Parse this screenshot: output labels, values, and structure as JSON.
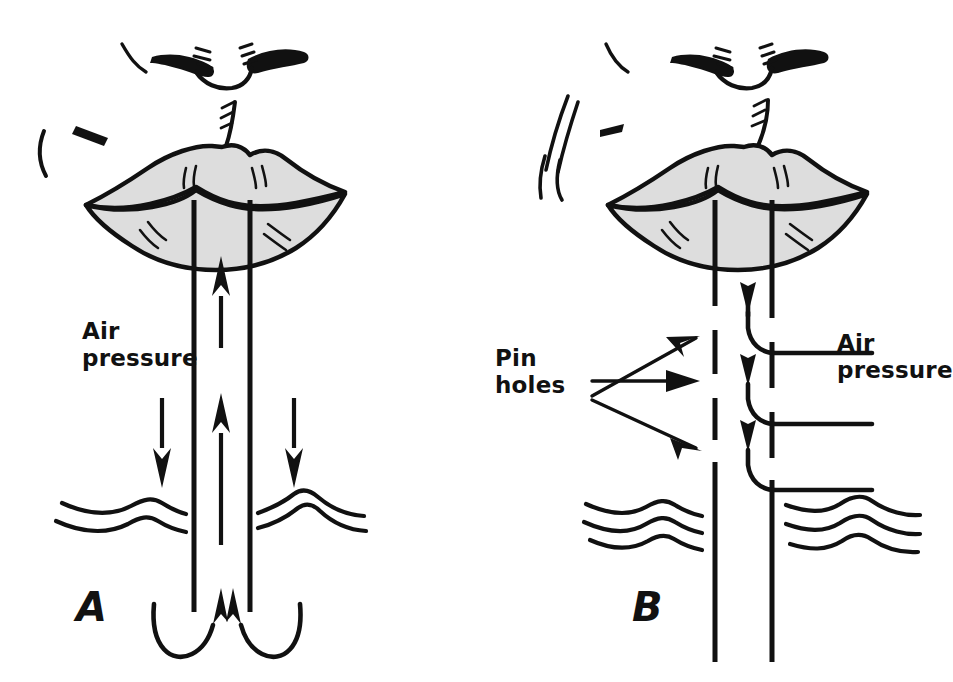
{
  "figure": {
    "background_color": "#ffffff",
    "ink_color": "#111111",
    "lip_fill_color": "#dddddd",
    "width": 950,
    "height": 682
  },
  "panels": [
    {
      "id": "A",
      "letter": "A",
      "caption": "Intact straw",
      "labels": [
        {
          "name": "air-pressure",
          "line1": "Air",
          "line2": "pressure"
        }
      ],
      "straw": {
        "style": "solid",
        "left_wall_x": 194,
        "right_wall_x": 250,
        "top_y": 200,
        "bottom_y": 612
      },
      "liquid_surface_y": 505,
      "arrows": {
        "downward_outside": 2,
        "upward_inside": 2,
        "curved_inflow": 2
      }
    },
    {
      "id": "B",
      "letter": "B",
      "caption": "Straw with pin holes",
      "labels": [
        {
          "name": "pin-holes",
          "line1": "Pin",
          "line2": "holes"
        },
        {
          "name": "air-pressure",
          "line1": "Air",
          "line2": "pressure"
        }
      ],
      "straw": {
        "style": "dashed",
        "left_wall_x": 715,
        "right_wall_x": 772,
        "top_y": 200,
        "bottom_y": 660
      },
      "liquid_surface_y": 505,
      "pin_hole_count": 3,
      "arrows": {
        "pointer_to_holes": 3,
        "curved_inflow_through_holes": 3
      }
    }
  ],
  "labels": {
    "air_pressure_line1": "Air",
    "air_pressure_line2": "pressure",
    "pin_holes_line1": "Pin",
    "pin_holes_line2": "holes",
    "panel_a_letter": "A",
    "panel_b_letter": "B"
  }
}
